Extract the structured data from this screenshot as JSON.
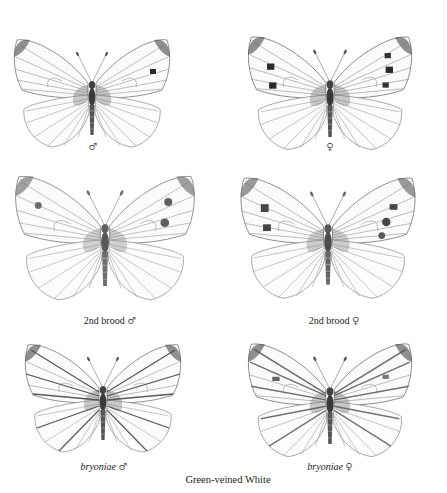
{
  "plate": {
    "caption": "Green-veined White",
    "colors": {
      "background": "#ffffff",
      "ink": "#222222",
      "vein": "#555555",
      "spot": "#2a2a2a"
    }
  },
  "figures": [
    {
      "id": "male",
      "label_prefix": "",
      "label_italic": "",
      "symbol": "♂",
      "cx": 92,
      "cy": 95,
      "scale": 1.0,
      "spots": 1
    },
    {
      "id": "female",
      "label_prefix": "",
      "label_italic": "",
      "symbol": "♀",
      "cx": 330,
      "cy": 95,
      "scale": 1.05,
      "spots": 3
    },
    {
      "id": "second-brood-male",
      "label_prefix": "2nd brood",
      "label_italic": "",
      "symbol": "♂",
      "cx": 105,
      "cy": 240,
      "scale": 1.15,
      "spots": 1
    },
    {
      "id": "second-brood-female",
      "label_prefix": "2nd brood",
      "label_italic": "",
      "symbol": "♀",
      "cx": 328,
      "cy": 240,
      "scale": 1.12,
      "spots": 3
    },
    {
      "id": "bryoniae-male",
      "label_prefix": "",
      "label_italic": "bryoniae",
      "symbol": "♂",
      "cx": 103,
      "cy": 400,
      "scale": 1.0,
      "spots": 0
    },
    {
      "id": "bryoniae-female",
      "label_prefix": "",
      "label_italic": "bryoniae",
      "symbol": "♀",
      "cx": 330,
      "cy": 402,
      "scale": 1.05,
      "spots": 2
    }
  ]
}
